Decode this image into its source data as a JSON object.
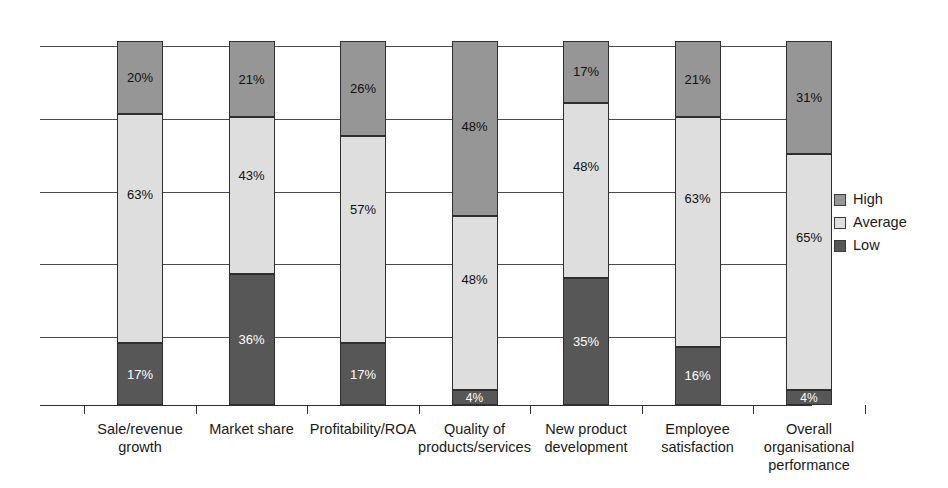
{
  "chart_data": {
    "type": "bar",
    "subtype": "stacked-bar-100",
    "title": "",
    "xlabel": "",
    "ylabel": "",
    "ylim": [
      0,
      100
    ],
    "grid": true,
    "grid_values": [
      100,
      80,
      60,
      40,
      20
    ],
    "legend_position": "right",
    "categories": [
      "Sale/revenue growth",
      "Market share",
      "Profitability/ROA",
      "Quality of products/services",
      "New product development",
      "Employee satisfaction",
      "Overall organisational performance"
    ],
    "category_label_lines": [
      [
        "Sale/revenue",
        "growth"
      ],
      [
        "Market share"
      ],
      [
        "Profitability/ROA"
      ],
      [
        "Quality of",
        "products/services"
      ],
      [
        "New product",
        "development"
      ],
      [
        "Employee",
        "satisfaction"
      ],
      [
        "Overall",
        "organisational",
        "performance"
      ]
    ],
    "series": [
      {
        "name": "High",
        "color": "#969696",
        "values": [
          20,
          21,
          26,
          48,
          17,
          21,
          31
        ],
        "labels": [
          "20%",
          "21%",
          "26%",
          "48%",
          "17%",
          "21%",
          "31%"
        ]
      },
      {
        "name": "Average",
        "color": "#dedede",
        "values": [
          63,
          43,
          57,
          48,
          48,
          63,
          65
        ],
        "labels": [
          "63%",
          "43%",
          "57%",
          "48%",
          "48%",
          "63%",
          "65%"
        ]
      },
      {
        "name": "Low",
        "color": "#575757",
        "values": [
          17,
          36,
          17,
          4,
          35,
          16,
          4
        ],
        "labels": [
          "17%",
          "36%",
          "17%",
          "4%",
          "35%",
          "16%",
          "4%"
        ]
      }
    ]
  },
  "legend": {
    "items": [
      {
        "label": "High",
        "color": "#969696"
      },
      {
        "label": "Average",
        "color": "#dedede"
      },
      {
        "label": "Low",
        "color": "#575757"
      }
    ]
  }
}
